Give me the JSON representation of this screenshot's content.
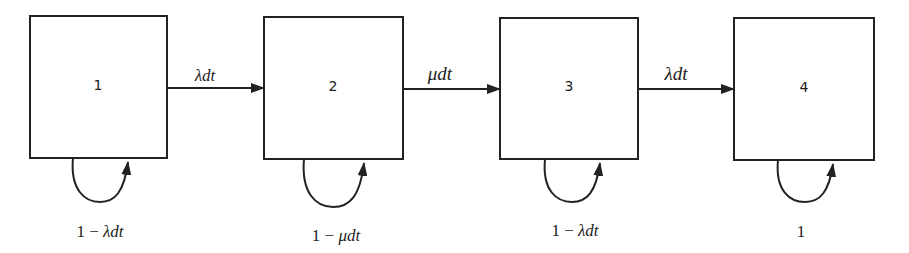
{
  "diagram": {
    "type": "markov-chain",
    "colors": {
      "stroke": "#222222",
      "background": "#ffffff"
    },
    "states": [
      {
        "id": "1",
        "label": "1",
        "self_loop": {
          "prefix": "1 − ",
          "rate": "λdt"
        }
      },
      {
        "id": "2",
        "label": "2",
        "self_loop": {
          "prefix": "1 − ",
          "rate": "μdt"
        }
      },
      {
        "id": "3",
        "label": "3",
        "self_loop": {
          "prefix": "1 − ",
          "rate": "λdt"
        }
      },
      {
        "id": "4",
        "label": "4",
        "self_loop": {
          "prefix": "1",
          "rate": ""
        }
      }
    ],
    "transitions": [
      {
        "from": "1",
        "to": "2",
        "label": "λdt"
      },
      {
        "from": "2",
        "to": "3",
        "label": "μdt"
      },
      {
        "from": "3",
        "to": "4",
        "label": "λdt"
      }
    ]
  }
}
